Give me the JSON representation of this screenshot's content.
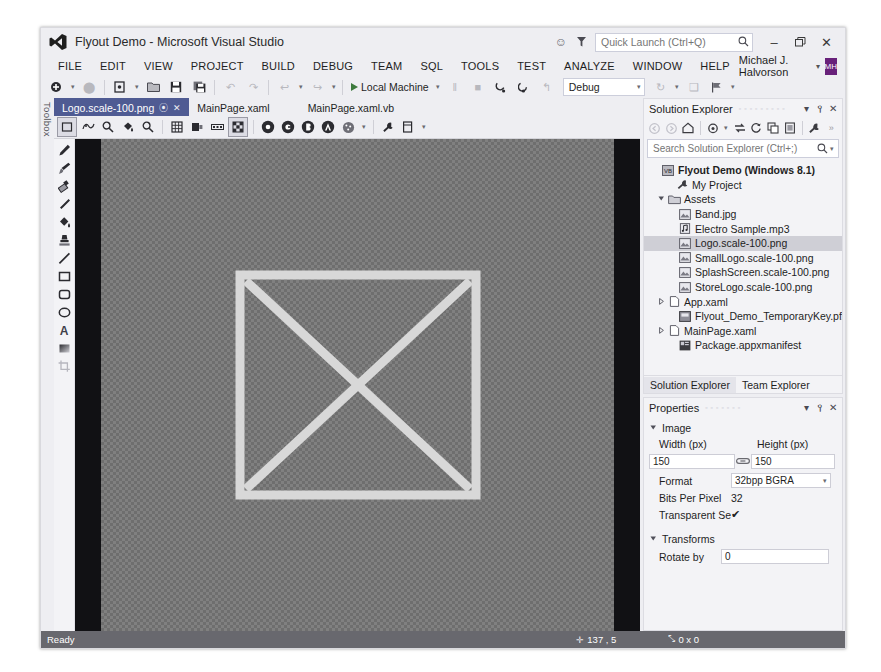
{
  "window": {
    "title": "Flyout Demo - Microsoft Visual Studio",
    "logo_name": "visual-studio-logo",
    "minimize": "–",
    "restore": "❐",
    "close": "✕",
    "feedback_icon": "☺",
    "notify_icon": "▼"
  },
  "quick_launch": {
    "placeholder": "Quick Launch (Ctrl+Q)",
    "value": "",
    "icon": "⌕"
  },
  "account": {
    "name": "Michael J. Halvorson",
    "caret": "▾",
    "initials": "MH",
    "color": "#68217a"
  },
  "menu": {
    "items": [
      {
        "label": "FILE",
        "accel": "F"
      },
      {
        "label": "EDIT",
        "accel": "E"
      },
      {
        "label": "VIEW",
        "accel": "V"
      },
      {
        "label": "PROJECT",
        "accel": "P"
      },
      {
        "label": "BUILD",
        "accel": "B"
      },
      {
        "label": "DEBUG",
        "accel": "D"
      },
      {
        "label": "TEAM",
        "accel": "M"
      },
      {
        "label": "SQL",
        "accel": "Q"
      },
      {
        "label": "TOOLS",
        "accel": "T"
      },
      {
        "label": "TEST",
        "accel": "S"
      },
      {
        "label": "ANALYZE",
        "accel": "N"
      },
      {
        "label": "WINDOW",
        "accel": "W"
      },
      {
        "label": "HELP",
        "accel": "H"
      }
    ]
  },
  "toolbar": {
    "new_project": "⬤",
    "open_file": "▤",
    "save": "▮",
    "save_all": "▣",
    "undo": "↶",
    "redo": "↷",
    "nav_back": "↩",
    "nav_fwd": "↪",
    "run_label": "Local Machine",
    "pause": "‖",
    "stop": "■",
    "step_into": "↘",
    "step_over": "↷",
    "step_out": "↰",
    "config_value": "Debug",
    "config_caret": "▾",
    "refresh": "↻",
    "more": "▾",
    "flag": "⚑"
  },
  "toolbox_tab": {
    "label": "Toolbox"
  },
  "doc_tabs": [
    {
      "label": "Logo.scale-100.png",
      "active": true,
      "pin": "⦿",
      "close": "✕"
    },
    {
      "label": "MainPage.xaml",
      "active": false
    },
    {
      "label": "MainPage.xaml.vb",
      "active": false
    }
  ],
  "image_toolbar": {
    "buttons": [
      {
        "name": "select-rectangle-tool",
        "glyph": "□",
        "selected": true
      },
      {
        "name": "pan-rotate-icon",
        "glyph": "◔",
        "selected": false
      },
      {
        "name": "zoom-in-icon",
        "glyph": "⌕",
        "selected": false
      },
      {
        "name": "fill-bucket-icon",
        "glyph": "☗",
        "selected": false
      },
      {
        "name": "magnifier-icon",
        "glyph": "⌕",
        "selected": false
      },
      {
        "name": "grid-icon",
        "glyph": "▦",
        "selected": false
      },
      {
        "name": "mipmap-icon",
        "glyph": "▧",
        "selected": false
      },
      {
        "name": "filmstrip-icon",
        "glyph": "▥",
        "selected": false
      },
      {
        "name": "checkerboard-icon",
        "glyph": "▦",
        "selected": true
      },
      {
        "name": "channel-r-icon",
        "glyph": "R",
        "selected": false
      },
      {
        "name": "channel-g-icon",
        "glyph": "G",
        "selected": false
      },
      {
        "name": "channel-b-icon",
        "glyph": "B",
        "selected": false
      },
      {
        "name": "channel-a-icon",
        "glyph": "A",
        "selected": false
      },
      {
        "name": "alpha-blend-icon",
        "glyph": "◌",
        "selected": false
      },
      {
        "name": "tool-options-icon",
        "glyph": "⚒",
        "selected": false
      },
      {
        "name": "properties-icon",
        "glyph": "⌸",
        "selected": false
      }
    ]
  },
  "tool_palette": {
    "tools": [
      {
        "name": "pencil-tool",
        "glyph": "✏"
      },
      {
        "name": "brush-tool",
        "glyph": "✒"
      },
      {
        "name": "eraser-tool",
        "glyph": "◧"
      },
      {
        "name": "eyedropper-tool",
        "glyph": "✐"
      },
      {
        "name": "fill-tool",
        "glyph": "☗"
      },
      {
        "name": "stamp-tool",
        "glyph": "❖"
      },
      {
        "name": "line-tool",
        "glyph": "╱"
      },
      {
        "name": "rectangle-tool",
        "glyph": "□"
      },
      {
        "name": "rounded-rectangle-tool",
        "glyph": "▢"
      },
      {
        "name": "ellipse-tool",
        "glyph": "◯"
      },
      {
        "name": "text-tool",
        "glyph": "A"
      },
      {
        "name": "gradient-tool",
        "glyph": "◨"
      },
      {
        "name": "crop-tool",
        "glyph": "✛"
      }
    ]
  },
  "canvas": {
    "artwork_name": "logo-x-square-artwork",
    "stroke_color": "#d6d6d6"
  },
  "solution_explorer": {
    "title": "Solution Explorer",
    "ghost": "▫ ▫ ▫ ▫ ▫ ▫ ▫ ▫ ▫",
    "dropdown": "▾",
    "pin": "⫯",
    "close": "✕",
    "toolbar": [
      {
        "name": "back-icon",
        "glyph": "◀",
        "dim": true
      },
      {
        "name": "forward-icon",
        "glyph": "▶",
        "dim": true
      },
      {
        "name": "home-icon",
        "glyph": "⌂",
        "dim": false
      },
      {
        "name": "pending-changes-icon",
        "glyph": "◔",
        "dim": false
      },
      {
        "name": "dropdown-caret-icon",
        "glyph": "▾",
        "dim": false
      },
      {
        "name": "sync-with-document-icon",
        "glyph": "⇄",
        "dim": false
      },
      {
        "name": "refresh-icon",
        "glyph": "↻",
        "dim": false
      },
      {
        "name": "collapse-all-icon",
        "glyph": "⧉",
        "dim": false
      },
      {
        "name": "show-all-files-icon",
        "glyph": "▣",
        "dim": false
      },
      {
        "name": "properties-icon",
        "glyph": "⚒",
        "dim": false
      },
      {
        "name": "overflow-icon",
        "glyph": "»",
        "dim": false
      }
    ],
    "search": {
      "placeholder": "Search Solution Explorer (Ctrl+;)",
      "value": "",
      "icon": "⌕",
      "caret": "▾"
    },
    "tree": [
      {
        "label": "Flyout Demo (Windows 8.1)",
        "indent": 0,
        "arrow": "",
        "icon": "VB",
        "icon_kind": "project",
        "bold": true,
        "selected": false
      },
      {
        "label": "My Project",
        "indent": 1,
        "arrow": "",
        "icon": "⚒",
        "icon_kind": "wrench",
        "bold": false,
        "selected": false
      },
      {
        "label": "Assets",
        "indent": 1,
        "arrow": "▼",
        "icon": "▱",
        "icon_kind": "folder",
        "bold": false,
        "selected": false
      },
      {
        "label": "Band.jpg",
        "indent": 2,
        "arrow": "",
        "icon": "▨",
        "icon_kind": "image",
        "bold": false,
        "selected": false
      },
      {
        "label": "Electro Sample.mp3",
        "indent": 2,
        "arrow": "",
        "icon": "♪",
        "icon_kind": "audio",
        "bold": false,
        "selected": false
      },
      {
        "label": "Logo.scale-100.png",
        "indent": 2,
        "arrow": "",
        "icon": "▨",
        "icon_kind": "image",
        "bold": false,
        "selected": true
      },
      {
        "label": "SmallLogo.scale-100.png",
        "indent": 2,
        "arrow": "",
        "icon": "▨",
        "icon_kind": "image",
        "bold": false,
        "selected": false
      },
      {
        "label": "SplashScreen.scale-100.png",
        "indent": 2,
        "arrow": "",
        "icon": "▨",
        "icon_kind": "image",
        "bold": false,
        "selected": false
      },
      {
        "label": "StoreLogo.scale-100.png",
        "indent": 2,
        "arrow": "",
        "icon": "▨",
        "icon_kind": "image",
        "bold": false,
        "selected": false
      },
      {
        "label": "App.xaml",
        "indent": 1,
        "arrow": "▶",
        "icon": "▧",
        "icon_kind": "xaml",
        "bold": false,
        "selected": false
      },
      {
        "label": "Flyout_Demo_TemporaryKey.pfx",
        "indent": 1,
        "arrow": "",
        "icon": "▣",
        "icon_kind": "cert",
        "bold": false,
        "selected": false
      },
      {
        "label": "MainPage.xaml",
        "indent": 1,
        "arrow": "▶",
        "icon": "▧",
        "icon_kind": "xaml",
        "bold": false,
        "selected": false
      },
      {
        "label": "Package.appxmanifest",
        "indent": 1,
        "arrow": "",
        "icon": "▤",
        "icon_kind": "manifest",
        "bold": false,
        "selected": false
      }
    ],
    "tabs": [
      {
        "label": "Solution Explorer",
        "active": true
      },
      {
        "label": "Team Explorer",
        "active": false
      }
    ]
  },
  "properties": {
    "title": "Properties",
    "ghost": "▫ ▫ ▫ ▫ ▫ ▫ ▫",
    "dropdown": "▾",
    "pin": "⫯",
    "close": "✕",
    "categories": [
      {
        "name": "Image",
        "arrow": "▼",
        "fields": {
          "width_label": "Width (px)",
          "width_value": "150",
          "height_label": "Height (px)",
          "height_value": "150",
          "link_icon": "⚭",
          "format_label": "Format",
          "format_value": "32bpp BGRA",
          "format_caret": "▾",
          "bpp_label": "Bits Per Pixel",
          "bpp_value": "32",
          "transparent_label": "Transparent Se",
          "transparent_checked": "✔"
        }
      },
      {
        "name": "Transforms",
        "arrow": "▼",
        "fields": {
          "rotate_label": "Rotate by",
          "rotate_value": "0"
        }
      }
    ]
  },
  "status_bar": {
    "message": "Ready",
    "cursor_icon": "✛",
    "cursor_value": "137 , 5",
    "size_icon": "⤡",
    "size_value": "0 x 0"
  }
}
